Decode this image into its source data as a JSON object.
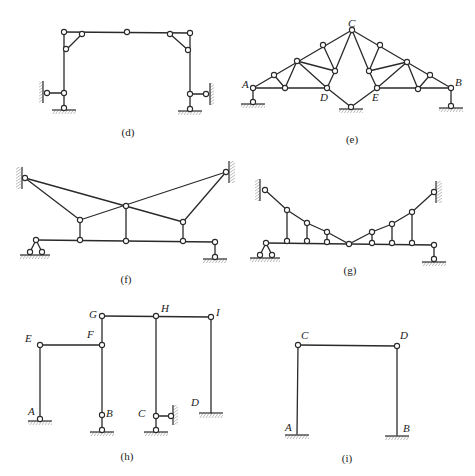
{
  "figures": {
    "d": {
      "caption": "(d)",
      "description": "Portal frame with three-hinged top, knee-brace links and hinged supports with horizontal links to walls"
    },
    "e": {
      "caption": "(e)",
      "description": "Composite truss with crown C, lower chord nodes D and E, end supports A and B and central support",
      "labels": {
        "A": "A",
        "B": "B",
        "C": "C",
        "D": "D",
        "E": "E"
      }
    },
    "f": {
      "caption": "(f)",
      "description": "Beam suspended by crossing cables from two walls with three vertical hangers"
    },
    "g": {
      "caption": "(g)",
      "description": "Beam suspended by V-shaped cable chain from two walls with six vertical hangers"
    },
    "h": {
      "caption": "(h)",
      "description": "Multi-bay frame with columns at A, B, C, D and joints E, F, G, H, I",
      "labels": {
        "A": "A",
        "B": "B",
        "C": "C",
        "D": "D",
        "E": "E",
        "F": "F",
        "G": "G",
        "H": "H",
        "I": "I"
      }
    },
    "i": {
      "caption": "(i)",
      "description": "Portal frame with fixed supports A, B and hinged joints C, D",
      "labels": {
        "A": "A",
        "B": "B",
        "C": "C",
        "D": "D"
      }
    }
  },
  "colors": {
    "line": "#2a2a2a",
    "background": "#ffffff"
  }
}
